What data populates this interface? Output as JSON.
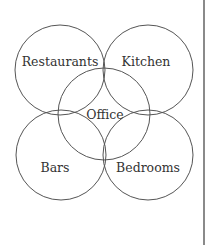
{
  "diagram": {
    "type": "venn",
    "stroke_color": "#555555",
    "text_color": "#333333",
    "sets": [
      {
        "id": "restaurants",
        "label": "Restaurants",
        "cx": 60,
        "cy": 70,
        "r": 45,
        "lx": 60,
        "ly": 66
      },
      {
        "id": "kitchen",
        "label": "Kitchen",
        "cx": 148,
        "cy": 70,
        "r": 45,
        "lx": 146,
        "ly": 66
      },
      {
        "id": "office",
        "label": "Office",
        "cx": 104,
        "cy": 114,
        "r": 46,
        "lx": 105,
        "ly": 119
      },
      {
        "id": "bars",
        "label": "Bars",
        "cx": 61,
        "cy": 155,
        "r": 45,
        "lx": 55,
        "ly": 172
      },
      {
        "id": "bedrooms",
        "label": "Bedrooms",
        "cx": 148,
        "cy": 155,
        "r": 45,
        "lx": 148,
        "ly": 172
      }
    ]
  }
}
